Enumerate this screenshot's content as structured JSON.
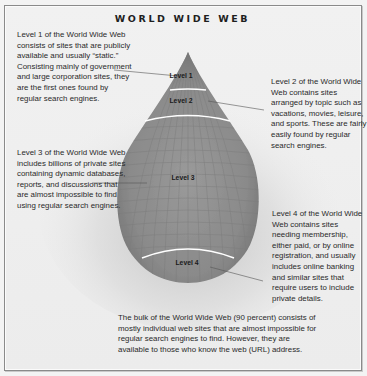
{
  "title": "WORLD WIDE WEB",
  "levels": [
    {
      "label": "Level 1",
      "description": "Level 1 of the World Wide Web consists of sites that are publicly available and usually “static.” Consisting mainly of government and large corporation sites, they are the first ones found by regular search engines."
    },
    {
      "label": "Level 2",
      "description": "Level 2 of the World Wide Web contains sites arranged by topic such as vacations, movies, leisure, and sports. These are fairly easily found by regular search engines."
    },
    {
      "label": "Level 3",
      "description": "Level 3 of the World Wide Web includes billions of private sites containing dynamic databases, reports, and discussions that are almost impossible to find using regular search engines."
    },
    {
      "label": "Level 4",
      "description": "Level 4 of the World Wide Web contains sites needing membership, either paid, or by online registration, and usually includes online banking and similar sites that require users to include private details."
    }
  ],
  "footer_note": "The bulk of the World Wide Web (90 percent) consists of mostly individual web sites that are almost impossible for regular search engines to find. However, they are available to those who know the web (URL) address.",
  "colors": {
    "drop_fill": "#8c8c8c",
    "band_line": "#ffffff",
    "leader_line": "#555555",
    "text": "#2a2a2a"
  }
}
